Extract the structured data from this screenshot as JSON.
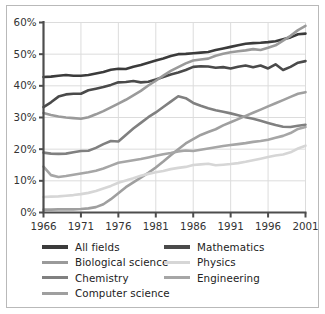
{
  "chart_data": {
    "type": "line",
    "title": "",
    "subtitle": "",
    "xlabel": "",
    "ylabel": "",
    "xlim": [
      1966,
      2001
    ],
    "ylim": [
      0,
      60
    ],
    "grid": true,
    "legend_position": "bottom",
    "x_tick_labels": [
      "1966",
      "1971",
      "1976",
      "1981",
      "1986",
      "1991",
      "1996",
      "2001"
    ],
    "x_ticks": [
      1966,
      1971,
      1976,
      1981,
      1986,
      1991,
      1996,
      2001
    ],
    "y_tick_labels": [
      "0%",
      "10%",
      "20%",
      "30%",
      "40%",
      "50%",
      "60%"
    ],
    "y_ticks": [
      0,
      10,
      20,
      30,
      40,
      50,
      60
    ],
    "x": [
      1966,
      1967,
      1968,
      1969,
      1970,
      1971,
      1972,
      1973,
      1974,
      1975,
      1976,
      1977,
      1978,
      1979,
      1980,
      1981,
      1982,
      1983,
      1984,
      1985,
      1986,
      1987,
      1988,
      1989,
      1990,
      1991,
      1992,
      1993,
      1994,
      1995,
      1996,
      1997,
      1998,
      1999,
      2000,
      2001
    ],
    "series": [
      {
        "name": "All fields",
        "color": "#3b3b3b",
        "width": 2.6,
        "values": [
          42.8,
          42.9,
          43.2,
          43.4,
          43.2,
          43.2,
          43.4,
          43.9,
          44.4,
          45.1,
          45.4,
          45.3,
          46.0,
          46.6,
          47.3,
          48.0,
          48.6,
          49.4,
          50.0,
          50.1,
          50.3,
          50.5,
          50.7,
          51.3,
          51.8,
          52.3,
          52.8,
          53.3,
          53.5,
          53.6,
          53.8,
          54.1,
          54.7,
          55.3,
          56.3,
          56.5
        ]
      },
      {
        "name": "Mathematics",
        "color": "#4a4a4a",
        "width": 2.6,
        "values": [
          33.3,
          34.8,
          36.6,
          37.3,
          37.5,
          37.5,
          38.6,
          39.1,
          39.6,
          40.3,
          41.1,
          41.2,
          41.5,
          41.1,
          41.3,
          42.0,
          42.8,
          43.6,
          44.2,
          45.0,
          46.0,
          46.2,
          46.1,
          45.7,
          45.9,
          45.5,
          46.0,
          46.4,
          45.9,
          46.4,
          45.5,
          46.8,
          45.0,
          46.0,
          47.3,
          47.8
        ]
      },
      {
        "name": "Biological science",
        "color": "#9a9a9a",
        "width": 2.6,
        "values": [
          31.4,
          30.8,
          30.3,
          30.0,
          29.8,
          29.6,
          30.1,
          31.0,
          32.0,
          33.2,
          34.4,
          35.6,
          37.0,
          38.4,
          40.1,
          41.6,
          43.2,
          44.7,
          45.9,
          47.1,
          48.0,
          48.3,
          48.6,
          49.5,
          50.1,
          50.6,
          50.9,
          51.2,
          51.6,
          51.3,
          52.0,
          52.8,
          54.3,
          55.8,
          57.6,
          58.9
        ]
      },
      {
        "name": "Chemistry",
        "color": "#808080",
        "width": 2.6,
        "values": [
          18.9,
          18.6,
          18.5,
          18.6,
          19.0,
          19.4,
          19.5,
          20.4,
          21.6,
          22.6,
          22.4,
          24.5,
          26.5,
          28.3,
          30.1,
          31.6,
          33.3,
          35.0,
          36.7,
          36.1,
          34.6,
          33.7,
          32.9,
          32.3,
          31.8,
          31.3,
          30.7,
          30.1,
          29.6,
          29.0,
          28.3,
          27.6,
          27.1,
          27.0,
          27.4,
          27.7
        ]
      },
      {
        "name": "Computer science",
        "color": "#9f9f9f",
        "width": 2.6,
        "values": [
          0.9,
          0.9,
          1.0,
          1.0,
          1.0,
          1.1,
          1.3,
          1.7,
          2.6,
          4.2,
          6.1,
          8.0,
          9.5,
          11.0,
          12.5,
          14.2,
          16.1,
          18.1,
          20.0,
          21.8,
          23.2,
          24.5,
          25.4,
          26.3,
          27.5,
          28.5,
          29.5,
          30.5,
          31.5,
          32.5,
          33.5,
          34.5,
          35.5,
          36.5,
          37.5,
          38.0
        ]
      },
      {
        "name": "Physics",
        "color": "#d6d6d6",
        "width": 2.6,
        "values": [
          4.9,
          5.0,
          5.1,
          5.3,
          5.5,
          5.8,
          6.2,
          6.8,
          7.6,
          8.4,
          9.4,
          10.1,
          10.8,
          11.6,
          12.2,
          12.7,
          13.1,
          13.7,
          14.1,
          14.4,
          15.0,
          15.2,
          15.4,
          14.9,
          15.1,
          15.3,
          15.6,
          16.0,
          16.5,
          17.0,
          17.5,
          18.0,
          18.3,
          19.0,
          20.2,
          21.1
        ]
      },
      {
        "name": "Engineering",
        "color": "#a6a6a6",
        "width": 2.6,
        "values": [
          14.5,
          11.8,
          11.2,
          11.5,
          11.9,
          12.3,
          12.7,
          13.2,
          13.9,
          14.8,
          15.7,
          16.1,
          16.5,
          16.9,
          17.4,
          17.9,
          18.4,
          18.8,
          19.3,
          19.6,
          19.4,
          19.8,
          20.2,
          20.6,
          21.0,
          21.3,
          21.6,
          21.9,
          22.3,
          22.6,
          23.0,
          23.6,
          24.2,
          25.1,
          26.4,
          27.0
        ]
      }
    ],
    "computer_science_overlay_note": ""
  },
  "legend": {
    "columns": [
      {
        "items": [
          {
            "label": "All fields",
            "color": "#3b3b3b",
            "thickness": 3.8
          },
          {
            "label": "Biological science",
            "color": "#9a9a9a",
            "thickness": 3.4
          },
          {
            "label": "Chemistry",
            "color": "#808080",
            "thickness": 3.4
          },
          {
            "label": "Computer science",
            "color": "#9f9f9f",
            "thickness": 3.4
          }
        ]
      },
      {
        "items": [
          {
            "label": "Mathematics",
            "color": "#4a4a4a",
            "thickness": 3.8
          },
          {
            "label": "Physics",
            "color": "#d6d6d6",
            "thickness": 3.4
          },
          {
            "label": "Engineering",
            "color": "#a6a6a6",
            "thickness": 3.4
          }
        ]
      }
    ]
  },
  "style": {
    "axis_color": "#4d4d4d",
    "grid_color": "#dcdcdc",
    "frame_color": "#b9b9b9",
    "tick_label_color": "#333333",
    "background": "#ffffff"
  }
}
